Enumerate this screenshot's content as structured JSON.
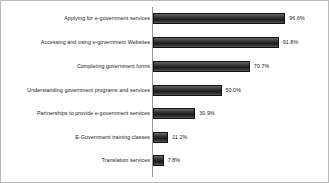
{
  "chart_data": {
    "type": "bar",
    "orientation": "horizontal",
    "title": "",
    "subtitle": "",
    "xlabel": "",
    "ylabel": "",
    "xlim": [
      0,
      100
    ],
    "grid": false,
    "legend": false,
    "value_suffix": "%",
    "categories": [
      "Applying for e-government services",
      "Accessing and using e-government Websites",
      "Completing government forms",
      "Understanding government programs and services",
      "Partnerships to provide e-government services",
      "E-Government training classes",
      "Translation services"
    ],
    "values": [
      96.6,
      91.8,
      70.7,
      50.0,
      30.9,
      11.2,
      7.8
    ],
    "data_labels": [
      "96.6%",
      "91.8%",
      "70.7%",
      "50.0%",
      "30.9%",
      "11.2%",
      "7.8%"
    ],
    "bar_color": "#2e2e2e",
    "axis_color": "#9a9a9a",
    "text_color": "#161616"
  }
}
